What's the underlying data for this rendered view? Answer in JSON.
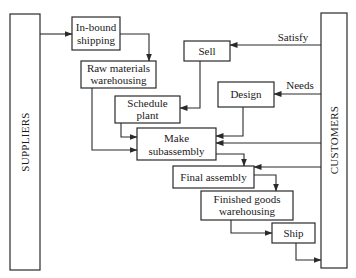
{
  "diagram": {
    "entities": {
      "suppliers": "SUPPLIERS",
      "customers": "CUSTOMERS"
    },
    "processes": {
      "inbound_shipping": [
        "In-bound",
        "shipping"
      ],
      "raw_materials": [
        "Raw materials",
        "warehousing"
      ],
      "schedule_plant": [
        "Schedule",
        "plant"
      ],
      "make_subassembly": [
        "Make",
        "subassembly"
      ],
      "final_assembly": [
        "Final assembly"
      ],
      "finished_goods": [
        "Finished goods",
        "warehousing"
      ],
      "ship": [
        "Ship"
      ],
      "sell": [
        "Sell"
      ],
      "design": [
        "Design"
      ]
    },
    "flow_labels": {
      "satisfy": "Satisfy",
      "needs": "Needs"
    },
    "colors": {
      "stroke": "#2a2a2a",
      "text": "#1a1a1a",
      "background": "#ffffff"
    }
  }
}
